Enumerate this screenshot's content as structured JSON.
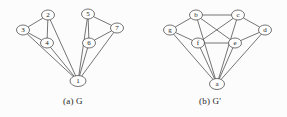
{
  "figure": {
    "background_color": "#fcfcfc",
    "stroke_color": "#3a3a3a",
    "node_fill_color": "#fdfdfd"
  },
  "captions": {
    "left": "(a) G",
    "right": "(b) G'"
  },
  "chart_data": {
    "type": "diagram",
    "title": "",
    "subtitle": "",
    "graphs": [
      {
        "name": "G",
        "caption": "(a) G",
        "node_labels": [
          "1",
          "2",
          "3",
          "4",
          "5",
          "6",
          "7"
        ],
        "nodes": [
          {
            "id": "1",
            "label": "1",
            "x": 78,
            "y": 81,
            "rx": 8,
            "ry": 5.5
          },
          {
            "id": "2",
            "label": "2",
            "x": 48,
            "y": 15,
            "rx": 6.5,
            "ry": 5
          },
          {
            "id": "3",
            "label": "3",
            "x": 23,
            "y": 30,
            "rx": 6.5,
            "ry": 5
          },
          {
            "id": "4",
            "label": "4",
            "x": 47,
            "y": 43,
            "rx": 6.5,
            "ry": 5
          },
          {
            "id": "5",
            "label": "5",
            "x": 88,
            "y": 14,
            "rx": 6.5,
            "ry": 5
          },
          {
            "id": "6",
            "label": "6",
            "x": 89,
            "y": 43,
            "rx": 6.5,
            "ry": 5
          },
          {
            "id": "7",
            "label": "7",
            "x": 117,
            "y": 28,
            "rx": 6.5,
            "ry": 5
          }
        ],
        "edges": [
          {
            "from": "2",
            "to": "3"
          },
          {
            "from": "2",
            "to": "4"
          },
          {
            "from": "3",
            "to": "4"
          },
          {
            "from": "2",
            "to": "1"
          },
          {
            "from": "3",
            "to": "1"
          },
          {
            "from": "4",
            "to": "1"
          },
          {
            "from": "5",
            "to": "6"
          },
          {
            "from": "5",
            "to": "7"
          },
          {
            "from": "6",
            "to": "7"
          },
          {
            "from": "5",
            "to": "1"
          },
          {
            "from": "6",
            "to": "1"
          },
          {
            "from": "7",
            "to": "1"
          }
        ]
      },
      {
        "name": "G'",
        "caption": "(b) G'",
        "node_labels": [
          "a",
          "b",
          "c",
          "d",
          "e",
          "f",
          "g"
        ],
        "nodes": [
          {
            "id": "a",
            "label": "a",
            "x": 217,
            "y": 84,
            "rx": 7.5,
            "ry": 5.5
          },
          {
            "id": "b",
            "label": "b",
            "x": 196,
            "y": 15,
            "rx": 6.5,
            "ry": 5
          },
          {
            "id": "c",
            "label": "c",
            "x": 238,
            "y": 15,
            "rx": 6.5,
            "ry": 5
          },
          {
            "id": "d",
            "label": "d",
            "x": 265,
            "y": 30,
            "rx": 6.5,
            "ry": 5
          },
          {
            "id": "e",
            "label": "e",
            "x": 235,
            "y": 43,
            "rx": 6.5,
            "ry": 5
          },
          {
            "id": "f",
            "label": "f",
            "x": 198,
            "y": 43,
            "rx": 6.5,
            "ry": 5
          },
          {
            "id": "g",
            "label": "g",
            "x": 170,
            "y": 30,
            "rx": 6.5,
            "ry": 5
          }
        ],
        "edges": [
          {
            "from": "b",
            "to": "c"
          },
          {
            "from": "b",
            "to": "g"
          },
          {
            "from": "b",
            "to": "e"
          },
          {
            "from": "c",
            "to": "d"
          },
          {
            "from": "c",
            "to": "f"
          },
          {
            "from": "d",
            "to": "e"
          },
          {
            "from": "e",
            "to": "f"
          },
          {
            "from": "g",
            "to": "f"
          },
          {
            "from": "b",
            "to": "a"
          },
          {
            "from": "c",
            "to": "a"
          },
          {
            "from": "d",
            "to": "a"
          },
          {
            "from": "e",
            "to": "a"
          },
          {
            "from": "f",
            "to": "a"
          },
          {
            "from": "g",
            "to": "a"
          }
        ]
      }
    ]
  }
}
